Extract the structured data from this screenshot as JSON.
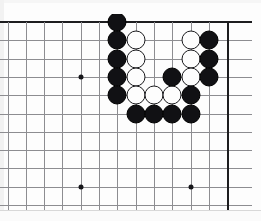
{
  "app": {
    "title": "Go board diagram",
    "kind": "go-board-position"
  },
  "board": {
    "name": "go-board",
    "grid_spacing_px": 18.3,
    "origin_x_px": 7.5,
    "origin_y_px": 8,
    "columns": 13,
    "rows": 11,
    "line_color": "#8d8d91",
    "edge_color": "#1d1d1f",
    "background_color": "#fdfdfd",
    "top_edge_row": 0,
    "right_edge_col": 12,
    "cropped_edges": [
      "left",
      "bottom"
    ]
  },
  "star_points": [
    {
      "col": 4,
      "row": 3
    },
    {
      "col": 4,
      "row": 9
    },
    {
      "col": 10,
      "row": 9
    }
  ],
  "stones": [
    {
      "color": "black",
      "col": 6,
      "row": 0
    },
    {
      "color": "black",
      "col": 6,
      "row": 1
    },
    {
      "color": "white",
      "col": 7,
      "row": 1
    },
    {
      "color": "white",
      "col": 10,
      "row": 1
    },
    {
      "color": "black",
      "col": 11,
      "row": 1
    },
    {
      "color": "black",
      "col": 6,
      "row": 2
    },
    {
      "color": "white",
      "col": 7,
      "row": 2
    },
    {
      "color": "white",
      "col": 10,
      "row": 2
    },
    {
      "color": "black",
      "col": 11,
      "row": 2
    },
    {
      "color": "black",
      "col": 6,
      "row": 3
    },
    {
      "color": "white",
      "col": 7,
      "row": 3
    },
    {
      "color": "black",
      "col": 9,
      "row": 3
    },
    {
      "color": "white",
      "col": 10,
      "row": 3
    },
    {
      "color": "black",
      "col": 11,
      "row": 3
    },
    {
      "color": "black",
      "col": 6,
      "row": 4
    },
    {
      "color": "white",
      "col": 7,
      "row": 4
    },
    {
      "color": "white",
      "col": 8,
      "row": 4
    },
    {
      "color": "white",
      "col": 9,
      "row": 4
    },
    {
      "color": "black",
      "col": 10,
      "row": 4
    },
    {
      "color": "black",
      "col": 7,
      "row": 5
    },
    {
      "color": "black",
      "col": 8,
      "row": 5
    },
    {
      "color": "black",
      "col": 9,
      "row": 5
    },
    {
      "color": "black",
      "col": 10,
      "row": 5
    }
  ],
  "colors": {
    "black_stone": "#111114",
    "white_stone": "#fdfdfd",
    "stone_outline": "#1a1a1d",
    "star_point": "#16161a",
    "page_background": "#ffffff"
  }
}
